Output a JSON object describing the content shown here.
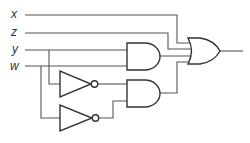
{
  "diagram": {
    "type": "logic-circuit",
    "inputs": [
      {
        "id": "x",
        "label": "x"
      },
      {
        "id": "z",
        "label": "z"
      },
      {
        "id": "y",
        "label": "y"
      },
      {
        "id": "w",
        "label": "w"
      }
    ],
    "gates": [
      {
        "id": "not1",
        "type": "NOT",
        "input": "y"
      },
      {
        "id": "not2",
        "type": "NOT",
        "input": "w"
      },
      {
        "id": "and1",
        "type": "AND",
        "inputs": [
          "y",
          "w"
        ]
      },
      {
        "id": "and2",
        "type": "AND",
        "inputs": [
          "not1",
          "not2"
        ]
      },
      {
        "id": "or1",
        "type": "OR",
        "inputs": [
          "x",
          "z",
          "and1",
          "and2"
        ]
      }
    ],
    "output": "or1"
  }
}
